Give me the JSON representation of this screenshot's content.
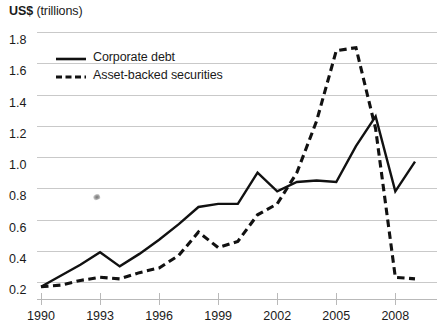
{
  "chart_data": {
    "type": "line",
    "title": "US$ (trillions)",
    "title_bold_part": "US$",
    "title_rest_part": " (trillions)",
    "xlabel": "",
    "ylabel": "US$ (trillions)",
    "ylim": [
      0.1,
      1.8
    ],
    "xlim": [
      1990,
      2009
    ],
    "grid": true,
    "grid_axis": "y",
    "legend_position": "top-left-inside",
    "yticks": [
      "1.8",
      "1.6",
      "1.4",
      "1.2",
      "1.0",
      "0.8",
      "0.6",
      "0.4",
      "0.2"
    ],
    "ytick_values": [
      1.8,
      1.6,
      1.4,
      1.2,
      1.0,
      0.8,
      0.6,
      0.4,
      0.2
    ],
    "xticks": [
      "1990",
      "1993",
      "1996",
      "1999",
      "2002",
      "2005",
      "2008"
    ],
    "xtick_values": [
      1990,
      1993,
      1996,
      1999,
      2002,
      2005,
      2008
    ],
    "x": [
      1990,
      1991,
      1992,
      1993,
      1994,
      1995,
      1996,
      1997,
      1998,
      1999,
      2000,
      2001,
      2002,
      2003,
      2004,
      2005,
      2006,
      2007,
      2008,
      2009
    ],
    "series": [
      {
        "name": "Corporate debt",
        "style": "solid",
        "color": "#111111",
        "values": [
          0.17,
          0.24,
          0.31,
          0.39,
          0.3,
          0.38,
          0.47,
          0.57,
          0.68,
          0.7,
          0.7,
          0.9,
          0.78,
          0.84,
          0.85,
          0.84,
          1.07,
          1.26,
          0.78,
          0.97
        ]
      },
      {
        "name": "Asset-backed securities",
        "style": "dashed",
        "color": "#111111",
        "values": [
          0.17,
          0.18,
          0.21,
          0.23,
          0.22,
          0.26,
          0.29,
          0.37,
          0.52,
          0.42,
          0.46,
          0.63,
          0.7,
          0.9,
          1.23,
          1.68,
          1.7,
          1.18,
          0.23,
          0.22
        ]
      }
    ]
  },
  "legend": {
    "items": [
      {
        "label": "Corporate debt",
        "style": "solid"
      },
      {
        "label": "Asset-backed securities",
        "style": "dashed"
      }
    ]
  }
}
